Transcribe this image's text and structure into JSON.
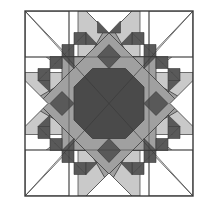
{
  "figure": {
    "kind": "quilt-block-diagram",
    "name": "Feathered Star Quilt Block",
    "canvas": {
      "width": 207,
      "height": 208
    },
    "block": {
      "x": 25,
      "y": 11,
      "width": 168,
      "height": 185
    }
  },
  "marks": {
    "left_tick": {
      "label": "-",
      "x": 3,
      "y": 62,
      "width": 9,
      "height": 2
    }
  },
  "palette": {
    "background": "#ffffff",
    "outline": "#3a3a3a",
    "light_gray": "#c9c9c9",
    "medium_gray": "#a0a0a0",
    "dark_gray": "#595959",
    "center_dark": "#4a4a4a",
    "white_patch": "#fdfdfd"
  },
  "geometry": {
    "note": "Block is an 8-pointed feathered star. Units measured on a 0-100 normalized grid inside the block frame.",
    "center": [
      50,
      50
    ],
    "octagon_radius": 18,
    "star_point_radius": 50,
    "feather_count_per_edge": 5,
    "corner_square_inset": 26
  },
  "legend": {
    "regions": [
      {
        "key": "center-octagon",
        "label": "Center octagon",
        "color": "#4a4a4a"
      },
      {
        "key": "star-points-cardinal",
        "label": "Cardinal star points",
        "color": "#a0a0a0"
      },
      {
        "key": "star-points-diagonal",
        "label": "Diagonal star rays",
        "color": "#c9c9c9"
      },
      {
        "key": "feather-triangles",
        "label": "Feather sawtooth triangles",
        "color": "#595959"
      },
      {
        "key": "corner-squares",
        "label": "Corner background squares",
        "color": "#ffffff"
      }
    ]
  }
}
